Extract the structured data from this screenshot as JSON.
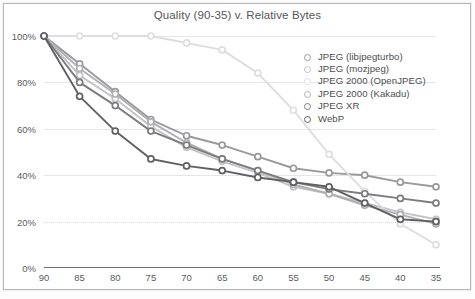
{
  "chart_data": {
    "type": "line",
    "title": "Quality (90-35) v. Relative Bytes",
    "xlabel": "",
    "ylabel": "",
    "categories": [
      "90",
      "85",
      "80",
      "75",
      "70",
      "65",
      "60",
      "55",
      "50",
      "45",
      "40",
      "35"
    ],
    "x": [
      90,
      85,
      80,
      75,
      70,
      65,
      60,
      55,
      50,
      45,
      40,
      35
    ],
    "xlim": [
      90,
      35
    ],
    "ylim": [
      0,
      100
    ],
    "ytick_labels": [
      "0%",
      "20%",
      "40%",
      "60%",
      "80%",
      "100%"
    ],
    "yticks": [
      0,
      20,
      40,
      60,
      80,
      100
    ],
    "grid": true,
    "legend_position": "inside-upper-right",
    "y_unit": "%",
    "series": [
      {
        "name": "JPEG (libjpegturbo)",
        "color": "#9a9a9c",
        "values": [
          100,
          88,
          76,
          64,
          57,
          53,
          48,
          43,
          41,
          40,
          37,
          35
        ]
      },
      {
        "name": "JPEG (mozjpeg)",
        "color": "#c3c3c5",
        "values": [
          100,
          83,
          73,
          61,
          52,
          46,
          41,
          35,
          32,
          28,
          24,
          21
        ]
      },
      {
        "name": "JPEG 2000 (OpenJPEG)",
        "color": "#dedee0",
        "values": [
          100,
          100,
          100,
          100,
          97,
          94,
          84,
          68,
          49,
          33,
          19,
          10
        ]
      },
      {
        "name": "JPEG 2000 (Kakadu)",
        "color": "#b0b0b2",
        "values": [
          100,
          86,
          75,
          63,
          54,
          47,
          42,
          36,
          32,
          27,
          23,
          19
        ]
      },
      {
        "name": "JPEG XR",
        "color": "#7c7c7e",
        "values": [
          100,
          80,
          70,
          59,
          53,
          47,
          42,
          37,
          34,
          32,
          30,
          28
        ]
      },
      {
        "name": "WebP",
        "color": "#606062",
        "values": [
          100,
          74,
          59,
          47,
          44,
          42,
          39,
          37,
          35,
          28,
          21,
          20
        ]
      }
    ]
  },
  "legend": {
    "items": [
      {
        "label": "JPEG (libjpegturbo)"
      },
      {
        "label": "JPEG (mozjpeg)"
      },
      {
        "label": "JPEG 2000 (OpenJPEG)"
      },
      {
        "label": "JPEG 2000 (Kakadu)"
      },
      {
        "label": "JPEG XR"
      },
      {
        "label": "WebP"
      }
    ]
  }
}
